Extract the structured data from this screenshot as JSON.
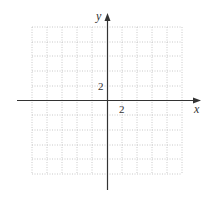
{
  "diagram": {
    "type": "coordinate-grid",
    "x_axis_label": "x",
    "y_axis_label": "y",
    "x_tick_label": "2",
    "y_tick_label": "2",
    "grid": {
      "columns": 10,
      "rows": 10,
      "units_per_cell": 1,
      "x_range": [
        -5,
        5
      ],
      "y_range": [
        -5,
        5
      ],
      "line_style": "dotted"
    },
    "colors": {
      "axis": "#333333",
      "grid": "#bbbbbb",
      "background": "#ffffff"
    }
  }
}
